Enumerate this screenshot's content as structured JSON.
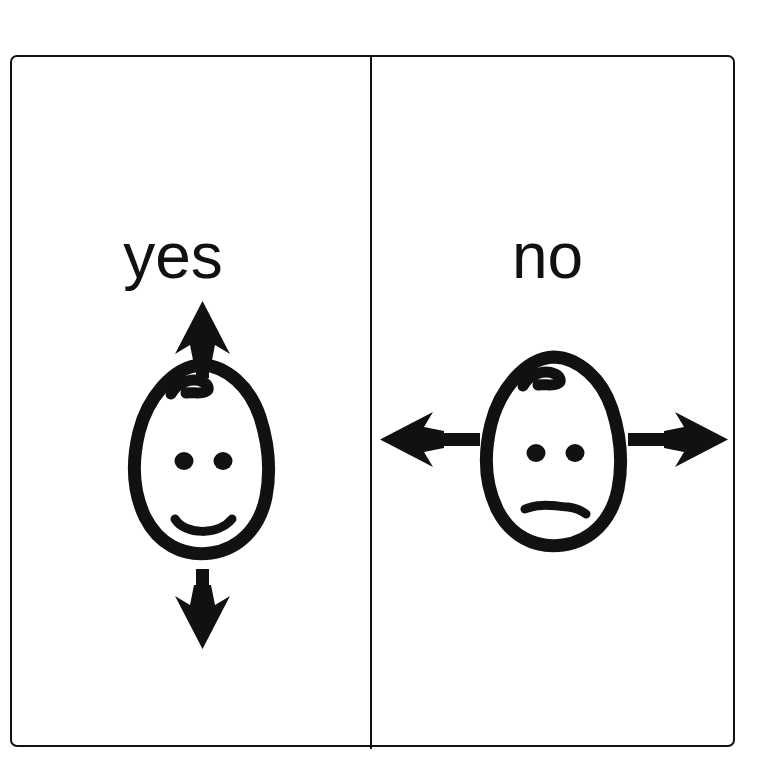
{
  "card": {
    "background_color": "#ffffff",
    "ink_color": "#111111",
    "border_color": "#111111",
    "panel_count": 2
  },
  "panels": [
    {
      "id": "yes",
      "label": "yes",
      "face": {
        "expression": "smiling",
        "mouth": "smile",
        "hair": "single-curl",
        "eyes": 2
      },
      "arrows": [
        {
          "name": "arrow-up",
          "direction": "up",
          "glyph": "↑"
        },
        {
          "name": "arrow-down",
          "direction": "down",
          "glyph": "↓"
        }
      ],
      "gesture_axis": "vertical"
    },
    {
      "id": "no",
      "label": "no",
      "face": {
        "expression": "neutral",
        "mouth": "flat",
        "hair": "single-curl",
        "eyes": 2
      },
      "arrows": [
        {
          "name": "arrow-left",
          "direction": "left",
          "glyph": "←"
        },
        {
          "name": "arrow-right",
          "direction": "right",
          "glyph": "→"
        }
      ],
      "gesture_axis": "horizontal"
    }
  ]
}
